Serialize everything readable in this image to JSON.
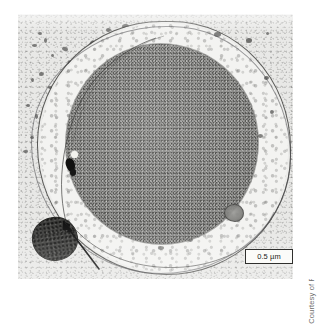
{
  "figure": {
    "type": "electron-micrograph"
  },
  "scale_bar": {
    "label": "0.5 µm",
    "value": 0.5,
    "unit": "µm"
  },
  "credit": {
    "text": "Courtesy of Rachel Reinhardt"
  },
  "annotations": {
    "arrow": {
      "name": "pointer-arrow",
      "points_to": "dark organelle at lower left"
    }
  },
  "structures": [
    {
      "name": "nucleus",
      "shade": "dark gray granular"
    },
    {
      "name": "cytoplasm",
      "shade": "light mottled"
    },
    {
      "name": "plasma-membrane",
      "shade": "thin dark outline"
    },
    {
      "name": "dark-organelle",
      "shade": "very dark oval"
    },
    {
      "name": "bright-vesicle",
      "shade": "white dot"
    }
  ],
  "colors": {
    "plate_background": "#e9e9e7",
    "nucleus": "#8b8b89",
    "cytoplasm": "#f3f3f1",
    "membrane": "#3a3a38",
    "dark_organelle": "#3b3b39",
    "page_background": "#ffffff",
    "credit_text": "#6e6e6c"
  }
}
